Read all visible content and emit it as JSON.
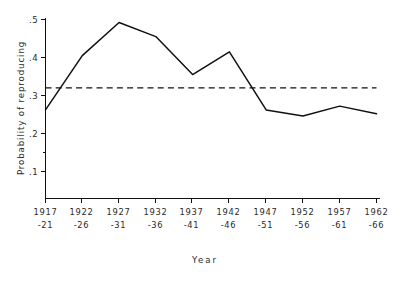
{
  "chart_data": {
    "type": "line",
    "title": "",
    "xlabel": "Year",
    "ylabel": "Probability of reproducing",
    "categories": [
      "1917\n-21",
      "1922\n-26",
      "1927\n-31",
      "1932\n-36",
      "1937\n-41",
      "1942\n-46",
      "1947\n-51",
      "1952\n-56",
      "1957\n-61",
      "1962\n-66"
    ],
    "x_tick_labels_line1": [
      "1917",
      "1922",
      "1927",
      "1932",
      "1937",
      "1942",
      "1947",
      "1952",
      "1957",
      "1962"
    ],
    "x_tick_labels_line2": [
      "-21",
      "-26",
      "-31",
      "-36",
      "-41",
      "-46",
      "-51",
      "-56",
      "-61",
      "-66"
    ],
    "values": [
      0.262,
      0.405,
      0.492,
      0.455,
      0.355,
      0.415,
      0.262,
      0.246,
      0.272,
      0.252
    ],
    "series": [
      {
        "name": "Probability of reproducing",
        "values": [
          0.262,
          0.405,
          0.492,
          0.455,
          0.355,
          0.415,
          0.262,
          0.246,
          0.272,
          0.252
        ]
      }
    ],
    "y_tick_labels": [
      ".5",
      ".4",
      ".3",
      ".2",
      "",
      ".1"
    ],
    "y_tick_values": [
      0.5,
      0.4,
      0.3,
      0.2,
      0.15,
      0.1
    ],
    "ylim": [
      0.085,
      0.515
    ],
    "grid": false,
    "legend": "none",
    "reference_line": {
      "value": 0.32,
      "style": "dashed",
      "label": ""
    },
    "line_color": "#111111",
    "axis_color": "#111111"
  }
}
